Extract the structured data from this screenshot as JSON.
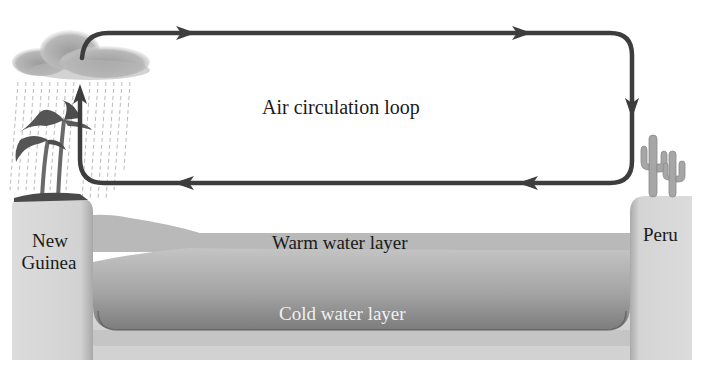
{
  "diagram": {
    "title": "Air circulation loop",
    "labels": {
      "loop": "Air circulation loop",
      "left_land_line1": "New",
      "left_land_line2": "Guinea",
      "right_land": "Peru",
      "warm_layer": "Warm water layer",
      "cold_layer": "Cold water layer"
    },
    "elements": {
      "left_land": {
        "name": "New Guinea",
        "features": [
          "rain-cloud",
          "rain",
          "palm-trees"
        ]
      },
      "right_land": {
        "name": "Peru",
        "features": [
          "cacti"
        ]
      },
      "air_loop": {
        "direction": "clockwise",
        "arrows": [
          "up-left",
          "right-top",
          "right-top-2",
          "down-right",
          "left-bottom",
          "left-bottom-2"
        ]
      }
    },
    "colors": {
      "arrow": "#3a3a3a",
      "land": "#d6d6d6",
      "warm_water": "#b8b8b8",
      "cold_water_top": "#bdbdbd",
      "cold_water_bottom": "#7a7a7a",
      "cloud": "#b0b0b0",
      "vegetation": "#555555",
      "cactus": "#a8a8a8"
    }
  }
}
